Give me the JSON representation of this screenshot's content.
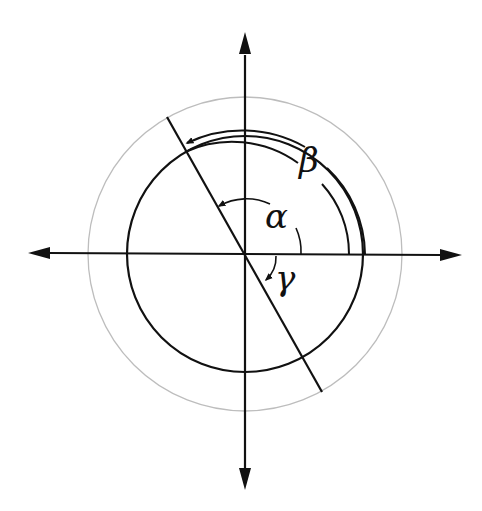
{
  "diagram": {
    "center": {
      "x": 245,
      "y": 254
    },
    "colors": {
      "stroke": "#111111",
      "guide_circle": "#b8b8b8",
      "background": "#ffffff"
    },
    "labels": {
      "alpha": "α",
      "beta": "β",
      "gamma": "γ"
    },
    "elements": {
      "outer_circle_radius": 157,
      "main_circle_radius": 118,
      "horizontal_axis": "double-headed arrow",
      "vertical_axis": "double-headed arrow",
      "diagonal_line": "line through center"
    }
  }
}
